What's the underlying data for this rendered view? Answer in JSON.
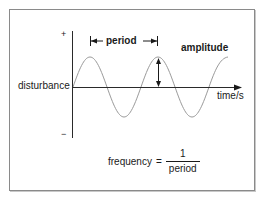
{
  "diagram": {
    "axes": {
      "y_axis_positive_label": "+",
      "y_axis_negative_label": "−",
      "y_axis_label": "disturbance",
      "x_axis_label": "time/s"
    },
    "annotations": {
      "period_label": "period",
      "amplitude_label": "amplitude"
    },
    "formula": {
      "lhs": "frequency",
      "equals": "=",
      "numerator": "1",
      "denominator": "period"
    },
    "wave": {
      "shape": "sine",
      "cycles_shown": 2.25,
      "color": "#9a9a9a"
    },
    "colors": {
      "axis": "#2a2a2a",
      "wave": "#9a9a9a",
      "text": "#1a1a1a",
      "frame": "#8a8a8a"
    }
  }
}
